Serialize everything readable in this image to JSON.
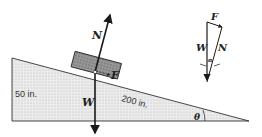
{
  "diagram": {
    "labels": {
      "normal": "N",
      "weight": "W",
      "force": "F",
      "angle": "θ",
      "alpha": "α"
    },
    "dimensions": {
      "height": "50 in.",
      "length": "200 in."
    },
    "force_triangle": {
      "F": "F",
      "W": "W",
      "N": "N",
      "alpha": "α"
    },
    "colors": {
      "incline_fill": "#e4e4e4",
      "block_fill": "#8a8a8a",
      "stroke": "#1a1a1a"
    }
  }
}
